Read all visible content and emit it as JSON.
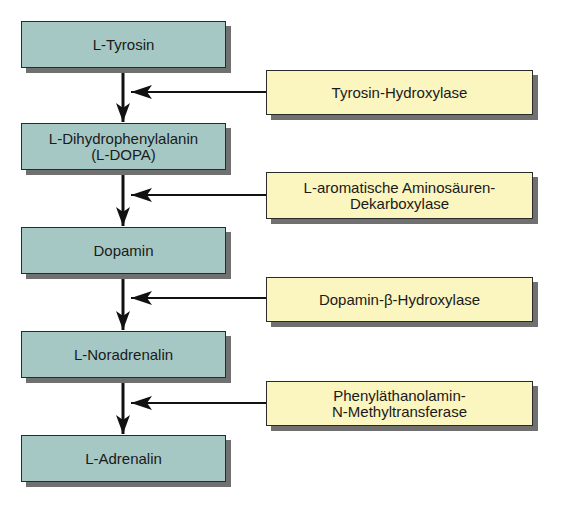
{
  "diagram": {
    "type": "biosynthesis-pathway",
    "colors": {
      "substrate_fill": "#a5c8c5",
      "enzyme_fill": "#fbf5bf",
      "border": "#2a2a2a",
      "shadow": "#707070",
      "arrow": "#111111"
    },
    "substrates": [
      {
        "id": "s1",
        "label": "L-Tyrosin"
      },
      {
        "id": "s2",
        "label": "L-Dihydrophenylalanin\n(L-DOPA)"
      },
      {
        "id": "s3",
        "label": "Dopamin"
      },
      {
        "id": "s4",
        "label": "L-Noradrenalin"
      },
      {
        "id": "s5",
        "label": "L-Adrenalin"
      }
    ],
    "enzymes": [
      {
        "id": "e1",
        "label": "Tyrosin-Hydroxylase",
        "acts_on": "s1 → s2"
      },
      {
        "id": "e2",
        "label": "L-aromatische Aminosäuren-\nDekarboxylase",
        "acts_on": "s2 → s3"
      },
      {
        "id": "e3",
        "label": "Dopamin-β-Hydroxylase",
        "acts_on": "s3 → s4"
      },
      {
        "id": "e4",
        "label": "Phenyläthanolamin-\nN-Methyltransferase",
        "acts_on": "s4 → s5"
      }
    ]
  }
}
